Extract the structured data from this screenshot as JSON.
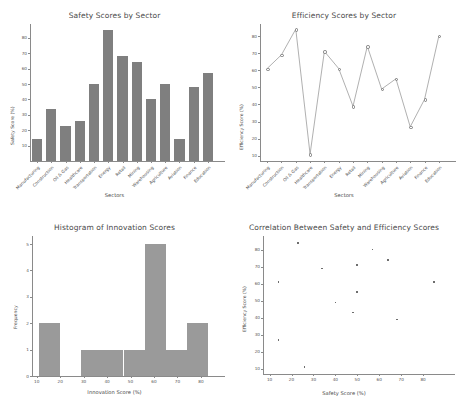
{
  "figure": {
    "background": "#ffffff",
    "bar_color": "#7f7f7f",
    "hist_color": "#9a9a9a",
    "line_color": "#7a7a7a",
    "marker_color": "#6e6e6e",
    "axis_color": "#8a8a8a",
    "text_color": "#4a4a4a"
  },
  "sectors": [
    "Manufacturing",
    "Construction",
    "Oil & Gas",
    "Healthcare",
    "Transportation",
    "Energy",
    "Retail",
    "Mining",
    "Warehousing",
    "Agriculture",
    "Aviation",
    "Finance",
    "Education"
  ],
  "chart_data": [
    {
      "type": "bar",
      "title": "Safety Scores by Sector",
      "xlabel": "Sectors",
      "ylabel": "Safety Score (%)",
      "categories": [
        "Manufacturing",
        "Construction",
        "Oil & Gas",
        "Healthcare",
        "Transportation",
        "Energy",
        "Retail",
        "Mining",
        "Warehousing",
        "Agriculture",
        "Aviation",
        "Finance",
        "Education"
      ],
      "values": [
        14,
        34,
        23,
        26,
        50,
        85,
        68,
        64,
        40,
        50,
        14,
        48,
        57
      ],
      "ylim": [
        0,
        89
      ],
      "yticks": [
        10,
        20,
        30,
        40,
        50,
        60,
        70,
        80
      ],
      "grid": false,
      "legend": "none"
    },
    {
      "type": "line",
      "title": "Efficiency Scores by Sector",
      "xlabel": "Sectors",
      "ylabel": "Efficiency Score (%)",
      "categories": [
        "Manufacturing",
        "Construction",
        "Oil & Gas",
        "Healthcare",
        "Transportation",
        "Energy",
        "Retail",
        "Mining",
        "Warehousing",
        "Agriculture",
        "Aviation",
        "Finance",
        "Education"
      ],
      "values": [
        61,
        69,
        84,
        11,
        71,
        61,
        39,
        74,
        49,
        55,
        27,
        43,
        80
      ],
      "ylim": [
        7,
        87
      ],
      "yticks": [
        10,
        20,
        30,
        40,
        50,
        60,
        70,
        80
      ],
      "grid": false,
      "legend": "none",
      "marker": "o"
    },
    {
      "type": "bar",
      "subtype": "histogram",
      "title": "Histogram of Innovation Scores",
      "xlabel": "Innovation Score (%)",
      "ylabel": "Frequency",
      "bin_edges": [
        11,
        20,
        29,
        38,
        47,
        56,
        65,
        74,
        83
      ],
      "counts": [
        2,
        0,
        1,
        1,
        1,
        5,
        1,
        2
      ],
      "xlim": [
        8,
        86
      ],
      "ylim": [
        0,
        5.3
      ],
      "xticks": [
        10,
        20,
        30,
        40,
        50,
        60,
        70,
        80
      ],
      "yticks": [
        0,
        1,
        2,
        3,
        4,
        5
      ],
      "grid": false,
      "legend": "none"
    },
    {
      "type": "scatter",
      "title": "Correlation Between Safety and Efficiency Scores",
      "xlabel": "Safety Score (%)",
      "ylabel": "Efficiency Score (%)",
      "x": [
        14,
        34,
        23,
        26,
        50,
        85,
        68,
        64,
        40,
        50,
        14,
        48,
        57
      ],
      "y": [
        61,
        69,
        84,
        11,
        71,
        61,
        39,
        74,
        49,
        55,
        27,
        43,
        80
      ],
      "point_labels": [
        "Manufacturing",
        "Construction",
        "Oil & Gas",
        "Healthcare",
        "Transportation",
        "Energy",
        "Retail",
        "Mining",
        "Warehousing",
        "Agriculture",
        "Aviation",
        "Finance",
        "Education"
      ],
      "xlim": [
        7,
        90
      ],
      "ylim": [
        7,
        88
      ],
      "xticks": [
        10,
        20,
        30,
        40,
        50,
        60,
        70,
        80
      ],
      "yticks": [
        10,
        20,
        30,
        40,
        50,
        60,
        70,
        80
      ],
      "grid": false,
      "legend": "none",
      "marker": "*"
    }
  ]
}
